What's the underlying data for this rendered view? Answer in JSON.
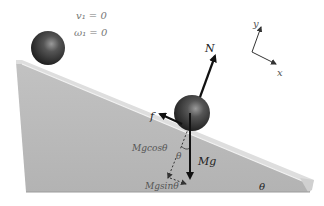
{
  "diagram": {
    "initial_conditions": {
      "velocity": "v₁ = 0",
      "angular_velocity": "ω₁ = 0"
    },
    "axes": {
      "x_label": "x",
      "y_label": "y"
    },
    "forces": {
      "normal": "N",
      "friction": "f",
      "gravity": "Mg",
      "gravity_perpendicular": "Mgcosθ",
      "gravity_parallel": "Mgsinθ"
    },
    "angles": {
      "force_angle": "θ",
      "incline_angle": "θ"
    },
    "colors": {
      "incline_face": "#b9b9b9",
      "incline_top": "#d6d6d6",
      "ball": "#3a3a3a",
      "arrows": "#111111"
    }
  }
}
